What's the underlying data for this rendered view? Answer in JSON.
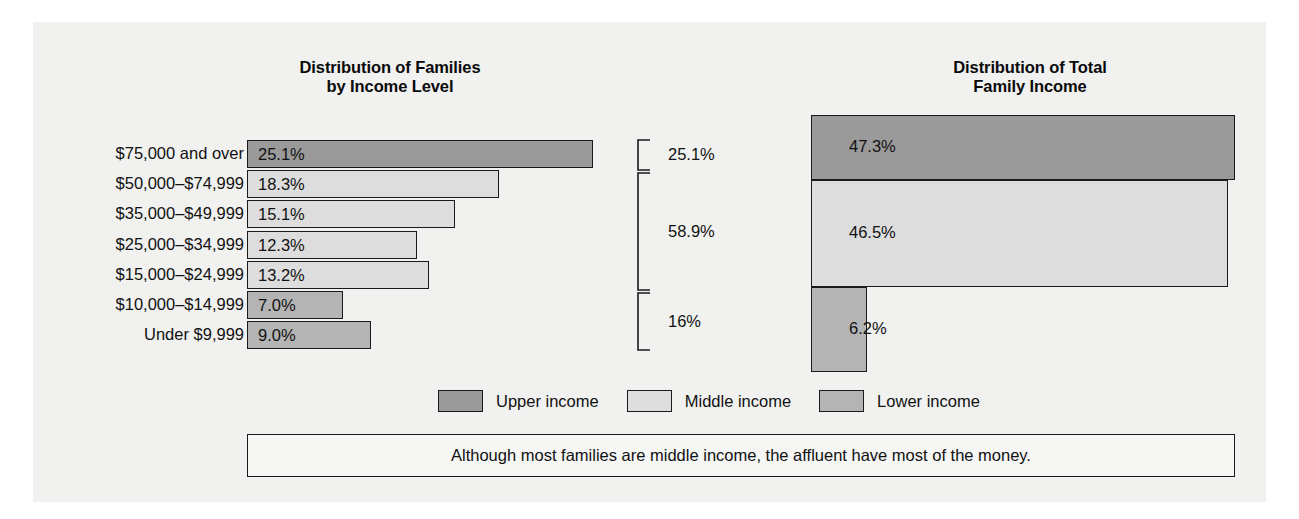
{
  "chart_data": [
    {
      "type": "bar",
      "title": "Distribution of Families by Income Level",
      "orientation": "horizontal",
      "categories": [
        "$75,000 and over",
        "$50,000–$74,999",
        "$35,000–$49,999",
        "$25,000–$34,999",
        "$15,000–$24,999",
        "$10,000–$14,999",
        "Under $9,999"
      ],
      "values": [
        25.1,
        18.3,
        15.1,
        12.3,
        13.2,
        7.0,
        9.0
      ],
      "value_labels": [
        "25.1%",
        "18.3%",
        "15.1%",
        "12.3%",
        "13.2%",
        "7.0%",
        "9.0%"
      ],
      "group_of_category": [
        "upper",
        "middle",
        "middle",
        "middle",
        "middle",
        "lower",
        "lower"
      ],
      "xlabel": "",
      "ylabel": "",
      "xlim": [
        0,
        25.1
      ],
      "grid": false,
      "annotations": [
        {
          "label": "25.1%",
          "spans_categories": [
            "$75,000 and over"
          ]
        },
        {
          "label": "58.9%",
          "spans_categories": [
            "$50,000–$74,999",
            "$35,000–$49,999",
            "$25,000–$34,999",
            "$15,000–$24,999"
          ]
        },
        {
          "label": "16%",
          "spans_categories": [
            "$10,000–$14,999",
            "Under $9,999"
          ]
        }
      ]
    },
    {
      "type": "bar",
      "title": "Distribution of Total Family Income",
      "orientation": "horizontal",
      "categories": [
        "Upper income",
        "Middle income",
        "Lower income"
      ],
      "values": [
        47.3,
        46.5,
        6.2
      ],
      "value_labels": [
        "47.3%",
        "46.5%",
        "6.2%"
      ],
      "group_of_category": [
        "upper",
        "middle",
        "lower"
      ],
      "xlabel": "",
      "ylabel": "",
      "xlim": [
        0,
        47.3
      ],
      "grid": false
    }
  ],
  "titles": {
    "left_line1": "Distribution of Families",
    "left_line2": "by Income Level",
    "right_line1": "Distribution of Total",
    "right_line2": "Family Income"
  },
  "left_chart": {
    "rows": [
      {
        "label": "$75,000 and over",
        "value_label": "25.1%",
        "value": 25.1,
        "group": "upper"
      },
      {
        "label": "$50,000–$74,999",
        "value_label": "18.3%",
        "value": 18.3,
        "group": "middle"
      },
      {
        "label": "$35,000–$49,999",
        "value_label": "15.1%",
        "value": 15.1,
        "group": "middle"
      },
      {
        "label": "$25,000–$34,999",
        "value_label": "12.3%",
        "value": 12.3,
        "group": "middle"
      },
      {
        "label": "$15,000–$24,999",
        "value_label": "13.2%",
        "value": 13.2,
        "group": "middle"
      },
      {
        "label": "$10,000–$14,999",
        "value_label": "7.0%",
        "value": 7.0,
        "group": "lower"
      },
      {
        "label": "Under $9,999",
        "value_label": "9.0%",
        "value": 9.0,
        "group": "lower"
      }
    ]
  },
  "brackets": [
    {
      "label": "25.1%",
      "top": 140,
      "bottom": 170
    },
    {
      "label": "58.9%",
      "top": 173,
      "bottom": 290
    },
    {
      "label": "16%",
      "top": 293,
      "bottom": 350
    }
  ],
  "right_chart": {
    "bars": [
      {
        "value_label": "47.3%",
        "value": 47.3,
        "group": "upper"
      },
      {
        "value_label": "46.5%",
        "value": 46.5,
        "group": "middle"
      },
      {
        "value_label": "6.2%",
        "value": 6.2,
        "group": "lower"
      }
    ]
  },
  "legend": {
    "items": [
      {
        "label": "Upper income",
        "color": "#9a9a9a"
      },
      {
        "label": "Middle income",
        "color": "#dddddd"
      },
      {
        "label": "Lower income",
        "color": "#b4b4b4"
      }
    ]
  },
  "caption": {
    "text": "Although most families are middle income, the affluent have most of the money."
  },
  "colors": {
    "upper": "#9a9a9a",
    "middle": "#dddddd",
    "lower": "#b4b4b4",
    "outline": "#1a1a1a",
    "panel": "#f1f1f0",
    "text": "#111111"
  }
}
